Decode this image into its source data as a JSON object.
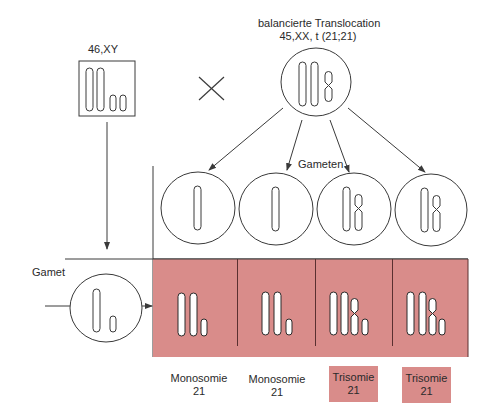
{
  "colors": {
    "cell_fill": "#d98c8a",
    "line": "#3a3a3a",
    "background": "#ffffff"
  },
  "father": {
    "karyotype": "46,XY",
    "chromosomes": [
      "long",
      "long",
      "short",
      "short"
    ]
  },
  "cross_symbol": "×",
  "mother": {
    "title": "balancierte Translocation",
    "karyotype": "45,XX, t (21;21)",
    "chromosomes": [
      "long",
      "long",
      "translocation"
    ]
  },
  "gametes_label": "Gameten",
  "maternal_gametes": [
    {
      "chromosomes": [
        "long"
      ]
    },
    {
      "chromosomes": [
        "long"
      ]
    },
    {
      "chromosomes": [
        "long",
        "translocation"
      ]
    },
    {
      "chromosomes": [
        "long",
        "translocation"
      ]
    }
  ],
  "paternal_gamete": {
    "label": "Gamet",
    "chromosomes": [
      "long",
      "short"
    ]
  },
  "zygotes": [
    {
      "chromosomes": [
        "long",
        "long",
        "short"
      ]
    },
    {
      "chromosomes": [
        "long",
        "long",
        "short"
      ]
    },
    {
      "chromosomes": [
        "long",
        "long",
        "translocation",
        "short"
      ]
    },
    {
      "chromosomes": [
        "long",
        "long",
        "translocation",
        "short"
      ]
    }
  ],
  "results": [
    {
      "line1": "Monosomie",
      "line2": "21",
      "highlighted": false
    },
    {
      "line1": "Monosomie",
      "line2": "21",
      "highlighted": false
    },
    {
      "line1": "Trisomie",
      "line2": "21",
      "highlighted": true
    },
    {
      "line1": "Trisomie",
      "line2": "21",
      "highlighted": true
    }
  ]
}
